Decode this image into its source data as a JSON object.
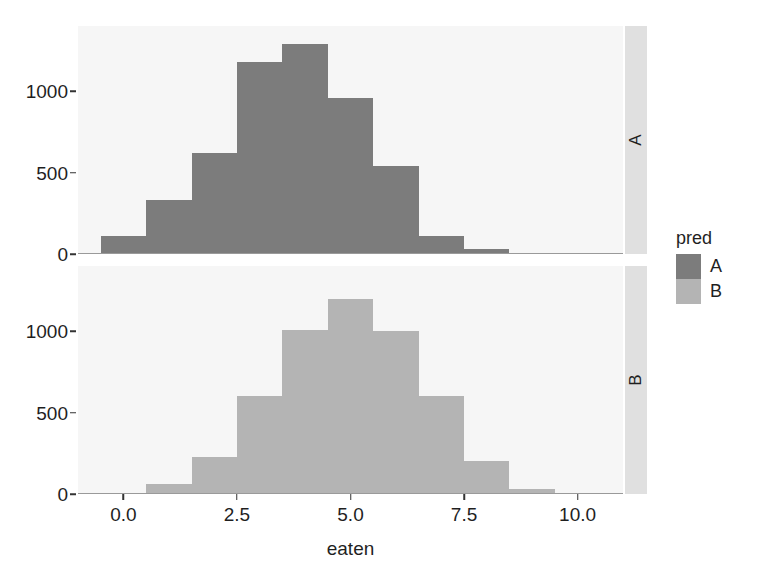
{
  "chart_data": {
    "type": "bar",
    "chart_kind": "histogram",
    "title": "",
    "subtitle": "",
    "xlabel": "eaten",
    "ylabel": "",
    "xlim": [
      -1.0,
      11.0
    ],
    "ylim": [
      0,
      1400
    ],
    "grid": false,
    "facet": {
      "variable": "pred",
      "direction": "vertical",
      "strip_position": "right",
      "levels": [
        "A",
        "B"
      ]
    },
    "legend": {
      "title": "pred",
      "position": "right",
      "entries": [
        {
          "label": "A",
          "color": "#7c7c7c"
        },
        {
          "label": "B",
          "color": "#b4b4b4"
        }
      ]
    },
    "xticks": [
      {
        "value": 0.0,
        "label": "0.0"
      },
      {
        "value": 2.5,
        "label": "2.5"
      },
      {
        "value": 5.0,
        "label": "5.0"
      },
      {
        "value": 7.5,
        "label": "7.5"
      },
      {
        "value": 10.0,
        "label": "10.0"
      }
    ],
    "yticks": [
      {
        "value": 0,
        "label": "0"
      },
      {
        "value": 500,
        "label": "500"
      },
      {
        "value": 1000,
        "label": "1000"
      }
    ],
    "bin_width": 1.0,
    "series": [
      {
        "name": "A",
        "facet": "A",
        "color": "#7c7c7c",
        "bins": [
          {
            "x0": -0.5,
            "x1": 0.5,
            "count": 110
          },
          {
            "x0": 0.5,
            "x1": 1.5,
            "count": 330
          },
          {
            "x0": 1.5,
            "x1": 2.5,
            "count": 620
          },
          {
            "x0": 2.5,
            "x1": 3.5,
            "count": 1180
          },
          {
            "x0": 3.5,
            "x1": 4.5,
            "count": 1290
          },
          {
            "x0": 4.5,
            "x1": 5.5,
            "count": 960
          },
          {
            "x0": 5.5,
            "x1": 6.5,
            "count": 540
          },
          {
            "x0": 6.5,
            "x1": 7.5,
            "count": 110
          },
          {
            "x0": 7.5,
            "x1": 8.5,
            "count": 30
          },
          {
            "x0": 8.5,
            "x1": 9.5,
            "count": 5
          }
        ]
      },
      {
        "name": "B",
        "facet": "B",
        "color": "#b4b4b4",
        "bins": [
          {
            "x0": 0.5,
            "x1": 1.5,
            "count": 60
          },
          {
            "x0": 1.5,
            "x1": 2.5,
            "count": 230
          },
          {
            "x0": 2.5,
            "x1": 3.5,
            "count": 600
          },
          {
            "x0": 3.5,
            "x1": 4.5,
            "count": 1010
          },
          {
            "x0": 4.5,
            "x1": 5.5,
            "count": 1200
          },
          {
            "x0": 5.5,
            "x1": 6.5,
            "count": 1000
          },
          {
            "x0": 6.5,
            "x1": 7.5,
            "count": 600
          },
          {
            "x0": 7.5,
            "x1": 8.5,
            "count": 200
          },
          {
            "x0": 8.5,
            "x1": 9.5,
            "count": 30
          }
        ]
      }
    ]
  }
}
